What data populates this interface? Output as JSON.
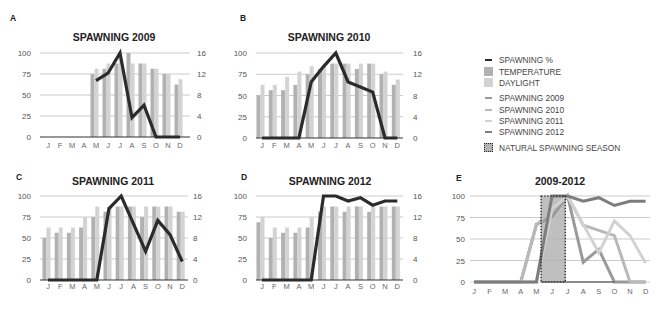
{
  "panels": [
    {
      "letter": "A",
      "title": "SPAWNING 2009"
    },
    {
      "letter": "B",
      "title": "SPAWNING 2010"
    },
    {
      "letter": "C",
      "title": "SPAWNING 2011"
    },
    {
      "letter": "D",
      "title": "SPAWNING 2012"
    },
    {
      "letter": "E",
      "title": "2009-2012"
    }
  ],
  "legend": {
    "items": [
      {
        "label": "SPAWNING %",
        "swatch": "line",
        "color": "#2b2b2b"
      },
      {
        "label": "TEMPERATURE",
        "swatch": "square",
        "color": "#b1b1b1"
      },
      {
        "label": "DAYLIGHT",
        "swatch": "square",
        "color": "#d3d3d3"
      },
      {
        "label": "SPAWNING 2009",
        "swatch": "line",
        "color": "#9a9a9a"
      },
      {
        "label": "SPAWNING 2010",
        "swatch": "line",
        "color": "#b9b9b9"
      },
      {
        "label": "SPAWNING 2011",
        "swatch": "line",
        "color": "#d2d2d2"
      },
      {
        "label": "SPAWNING 2012",
        "swatch": "line",
        "color": "#7d7d7d"
      },
      {
        "label": "NATURAL SPAWNING SEASON",
        "swatch": "dotted-box",
        "color": "#b4b4b4"
      }
    ]
  },
  "chart_data": [
    {
      "panel": "A",
      "type": "bar+line",
      "title": "SPAWNING 2009",
      "categories": [
        "J",
        "F",
        "M",
        "A",
        "M",
        "J",
        "J",
        "A",
        "S",
        "O",
        "N",
        "D"
      ],
      "left_axis": {
        "ticks": [
          0,
          25,
          50,
          75,
          100
        ],
        "max": 100,
        "label": "Spawning %"
      },
      "right_axis": {
        "ticks": [
          0,
          4,
          8,
          12,
          16
        ],
        "max": 16
      },
      "grid": true,
      "series": [
        {
          "name": "TEMPERATURE",
          "type": "bar",
          "axis": "right",
          "color": "#b1b1b1",
          "values": [
            null,
            null,
            null,
            null,
            12,
            13,
            14,
            16,
            14,
            13,
            12,
            10
          ]
        },
        {
          "name": "DAYLIGHT",
          "type": "bar",
          "axis": "right",
          "color": "#d3d3d3",
          "values": [
            null,
            null,
            null,
            null,
            13,
            14,
            15,
            14,
            14,
            13,
            12,
            11
          ]
        },
        {
          "name": "SPAWNING %",
          "type": "line",
          "axis": "left",
          "color": "#2b2b2b",
          "values": [
            null,
            null,
            null,
            null,
            67,
            76,
            100,
            23,
            38,
            0,
            0,
            0
          ]
        }
      ]
    },
    {
      "panel": "B",
      "type": "bar+line",
      "title": "SPAWNING 2010",
      "categories": [
        "J",
        "F",
        "M",
        "A",
        "M",
        "J",
        "J",
        "A",
        "S",
        "O",
        "N",
        "D"
      ],
      "left_axis": {
        "ticks": [
          0,
          25,
          50,
          75,
          100
        ],
        "max": 100,
        "label": "Spawning %"
      },
      "right_axis": {
        "ticks": [
          0,
          4,
          8,
          12,
          16
        ],
        "max": 16
      },
      "grid": true,
      "series": [
        {
          "name": "TEMPERATURE",
          "type": "bar",
          "axis": "right",
          "color": "#b1b1b1",
          "values": [
            8,
            9,
            9,
            10,
            12,
            13,
            14,
            14,
            13,
            14,
            12,
            10
          ]
        },
        {
          "name": "DAYLIGHT",
          "type": "bar",
          "axis": "right",
          "color": "#d3d3d3",
          "values": [
            10,
            10,
            11.5,
            12.5,
            13.5,
            13.5,
            14,
            14,
            14,
            14,
            12.5,
            11
          ]
        },
        {
          "name": "SPAWNING %",
          "type": "line",
          "axis": "left",
          "color": "#2b2b2b",
          "values": [
            0,
            0,
            0,
            0,
            66,
            84,
            100,
            66,
            60,
            54,
            0,
            0
          ]
        }
      ]
    },
    {
      "panel": "C",
      "type": "bar+line",
      "title": "SPAWNING 2011",
      "categories": [
        "J",
        "F",
        "M",
        "A",
        "M",
        "J",
        "J",
        "A",
        "S",
        "O",
        "N",
        "D"
      ],
      "left_axis": {
        "ticks": [
          0,
          25,
          50,
          75,
          100
        ],
        "max": 100,
        "label": "Spawning %"
      },
      "right_axis": {
        "ticks": [
          0,
          4,
          8,
          12,
          16
        ],
        "max": 16
      },
      "grid": true,
      "series": [
        {
          "name": "TEMPERATURE",
          "type": "bar",
          "axis": "right",
          "color": "#b1b1b1",
          "values": [
            8,
            9,
            9,
            10,
            12,
            13,
            14,
            14,
            12,
            14,
            14,
            13
          ]
        },
        {
          "name": "DAYLIGHT",
          "type": "bar",
          "axis": "right",
          "color": "#d3d3d3",
          "values": [
            10,
            10,
            10,
            12,
            14,
            14,
            14,
            14,
            14,
            14,
            14,
            13
          ]
        },
        {
          "name": "SPAWNING %",
          "type": "line",
          "axis": "left",
          "color": "#2b2b2b",
          "values": [
            0,
            0,
            0,
            0,
            0,
            85,
            100,
            67,
            34,
            71,
            54,
            22
          ]
        }
      ]
    },
    {
      "panel": "D",
      "type": "bar+line",
      "title": "SPAWNING 2012",
      "categories": [
        "J",
        "F",
        "M",
        "A",
        "M",
        "J",
        "J",
        "A",
        "S",
        "O",
        "N",
        "D"
      ],
      "left_axis": {
        "ticks": [
          0,
          25,
          50,
          75,
          100
        ],
        "max": 100,
        "label": "Spawning %"
      },
      "right_axis": {
        "ticks": [
          0,
          4,
          8,
          12,
          16
        ],
        "max": 16
      },
      "grid": true,
      "series": [
        {
          "name": "TEMPERATURE",
          "type": "bar",
          "axis": "right",
          "color": "#b1b1b1",
          "values": [
            11,
            8,
            9,
            9,
            10,
            13,
            14,
            13,
            14,
            13,
            14,
            14
          ]
        },
        {
          "name": "DAYLIGHT",
          "type": "bar",
          "axis": "right",
          "color": "#d3d3d3",
          "values": [
            12,
            10,
            10,
            10,
            12,
            14,
            14,
            14,
            14,
            14,
            14,
            14
          ]
        },
        {
          "name": "SPAWNING %",
          "type": "line",
          "axis": "left",
          "color": "#2b2b2b",
          "values": [
            0,
            0,
            0,
            0,
            0,
            100,
            100,
            94,
            98,
            89,
            94,
            94
          ]
        }
      ]
    },
    {
      "panel": "E",
      "type": "line",
      "title": "2009-2012",
      "categories": [
        "J",
        "F",
        "M",
        "A",
        "M",
        "J",
        "J",
        "A",
        "S",
        "O",
        "N",
        "D"
      ],
      "left_axis": {
        "ticks": [
          0,
          25,
          50,
          75,
          100
        ],
        "max": 100,
        "label": "Spawning %"
      },
      "grid": true,
      "series": [
        {
          "name": "SPAWNING 2009",
          "type": "line",
          "axis": "left",
          "color": "#9a9a9a",
          "values": [
            0,
            0,
            0,
            0,
            67,
            76,
            100,
            23,
            38,
            0,
            0,
            0
          ]
        },
        {
          "name": "SPAWNING 2010",
          "type": "line",
          "axis": "left",
          "color": "#b9b9b9",
          "values": [
            0,
            0,
            0,
            0,
            66,
            84,
            100,
            66,
            60,
            54,
            0,
            0
          ]
        },
        {
          "name": "SPAWNING 2011",
          "type": "line",
          "axis": "left",
          "color": "#d2d2d2",
          "values": [
            0,
            0,
            0,
            0,
            0,
            85,
            100,
            67,
            34,
            71,
            54,
            22
          ]
        },
        {
          "name": "SPAWNING 2012",
          "type": "line",
          "axis": "left",
          "color": "#7d7d7d",
          "values": [
            0,
            0,
            0,
            0,
            0,
            100,
            100,
            94,
            98,
            89,
            94,
            94
          ]
        }
      ],
      "annotations": [
        {
          "label": "NATURAL SPAWNING SEASON",
          "type": "shaded-span",
          "from_month_index": 4.3,
          "to_month_index": 5.85,
          "color": "#b4b4b4"
        }
      ]
    }
  ]
}
